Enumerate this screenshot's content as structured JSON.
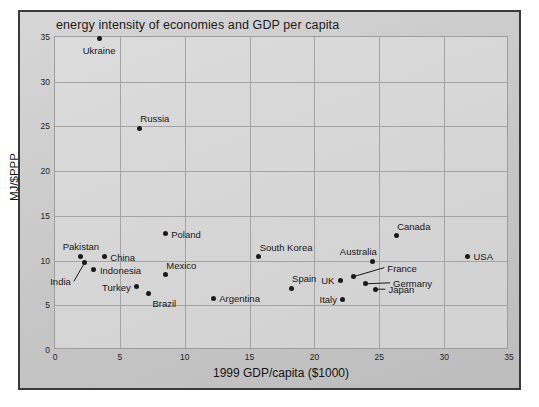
{
  "chart_data": {
    "type": "scatter",
    "title": "energy intensity of economies and GDP per capita",
    "xlabel": "1999 GDP/capita ($1000)",
    "ylabel": "MJ/$PPP",
    "xlim": [
      0,
      35
    ],
    "ylim": [
      0,
      35
    ],
    "xticks": [
      "0",
      "5",
      "10",
      "15",
      "20",
      "25",
      "30",
      "35"
    ],
    "yticks": [
      "0",
      "5",
      "10",
      "15",
      "20",
      "25",
      "30",
      "35"
    ],
    "grid": true,
    "legend": "none",
    "marker_color": "#1a1a1a",
    "points": [
      {
        "label": "Ukraine",
        "x": 3.4,
        "y": 34.8,
        "label_pos": "below"
      },
      {
        "label": "Russia",
        "x": 6.5,
        "y": 24.8,
        "label_pos": "above-right"
      },
      {
        "label": "Poland",
        "x": 8.5,
        "y": 13.0,
        "label_pos": "right"
      },
      {
        "label": "Canada",
        "x": 26.3,
        "y": 12.8,
        "label_pos": "above-right"
      },
      {
        "label": "Pakistan",
        "x": 2.0,
        "y": 10.5,
        "label_pos": "above"
      },
      {
        "label": "China",
        "x": 3.8,
        "y": 10.4,
        "label_pos": "right"
      },
      {
        "label": "USA",
        "x": 31.8,
        "y": 10.5,
        "label_pos": "right"
      },
      {
        "label": "South Korea",
        "x": 15.7,
        "y": 10.4,
        "label_pos": "above-right"
      },
      {
        "label": "Australia",
        "x": 24.5,
        "y": 9.9,
        "label_pos": "above-left"
      },
      {
        "label": "India",
        "x": 2.3,
        "y": 9.8,
        "label_pos": "leader-below-left"
      },
      {
        "label": "Indonesia",
        "x": 3.0,
        "y": 9.0,
        "label_pos": "right"
      },
      {
        "label": "Mexico",
        "x": 8.5,
        "y": 8.4,
        "label_pos": "above-right"
      },
      {
        "label": "France",
        "x": 23.0,
        "y": 8.2,
        "label_pos": "leader-right"
      },
      {
        "label": "UK",
        "x": 22.0,
        "y": 7.8,
        "label_pos": "left"
      },
      {
        "label": "Germany",
        "x": 23.9,
        "y": 7.4,
        "label_pos": "leader-right"
      },
      {
        "label": "Turkey",
        "x": 6.3,
        "y": 7.1,
        "label_pos": "left"
      },
      {
        "label": "Spain",
        "x": 18.2,
        "y": 6.9,
        "label_pos": "above-right"
      },
      {
        "label": "Japan",
        "x": 24.7,
        "y": 6.8,
        "label_pos": "leader-right"
      },
      {
        "label": "Brazil",
        "x": 7.2,
        "y": 6.3,
        "label_pos": "below-right"
      },
      {
        "label": "Argentina",
        "x": 12.2,
        "y": 5.8,
        "label_pos": "right"
      },
      {
        "label": "Italy",
        "x": 22.2,
        "y": 5.7,
        "label_pos": "left"
      }
    ]
  }
}
